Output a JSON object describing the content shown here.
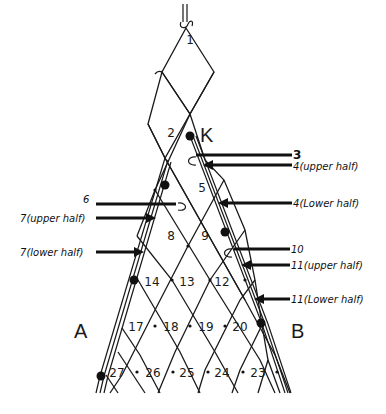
{
  "diagram": {
    "corner_label": "K",
    "side_labels": {
      "left": "A",
      "right": "B"
    },
    "meshes": [
      {
        "num": "1",
        "x": 190,
        "y": 40
      },
      {
        "num": "2",
        "x": 171,
        "y": 133
      },
      {
        "num": "5",
        "x": 202,
        "y": 188
      },
      {
        "num": "8",
        "x": 171,
        "y": 236
      },
      {
        "num": "9",
        "x": 205,
        "y": 236
      },
      {
        "num": "14",
        "x": 152,
        "y": 282
      },
      {
        "num": "13",
        "x": 187,
        "y": 282
      },
      {
        "num": "12",
        "x": 222,
        "y": 282
      },
      {
        "num": "17",
        "x": 136,
        "y": 327
      },
      {
        "num": "18",
        "x": 171,
        "y": 327
      },
      {
        "num": "19",
        "x": 206,
        "y": 327
      },
      {
        "num": "20",
        "x": 240,
        "y": 327
      },
      {
        "num": "27",
        "x": 117,
        "y": 373
      },
      {
        "num": "26",
        "x": 153,
        "y": 373
      },
      {
        "num": "25",
        "x": 187,
        "y": 373
      },
      {
        "num": "24",
        "x": 222,
        "y": 373
      },
      {
        "num": "23",
        "x": 258,
        "y": 373
      }
    ],
    "right_arrows": [
      {
        "num": "3",
        "text": "",
        "y": 155
      },
      {
        "num": "4",
        "text": "(upper half)",
        "y": 165
      },
      {
        "num": "4",
        "text": "(Lower half)",
        "y": 203
      },
      {
        "num": "10",
        "text": "",
        "y": 249
      },
      {
        "num": "11",
        "text": "(upper half)",
        "y": 265
      },
      {
        "num": "11",
        "text": "(Lower half)",
        "y": 299
      }
    ],
    "left_arrows": [
      {
        "num": "6",
        "text": "",
        "y": 204
      },
      {
        "num": "7",
        "text": "(upper half)",
        "y": 218
      },
      {
        "num": "7",
        "text": "(lower half)",
        "y": 252
      }
    ],
    "colors": {
      "ink": "#1a1a1a",
      "paper": "#ffffff"
    }
  }
}
